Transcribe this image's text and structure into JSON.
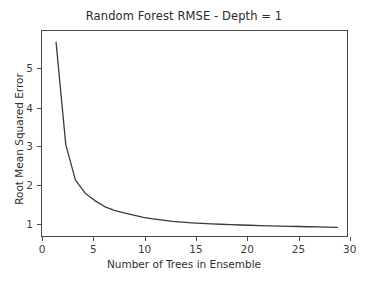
{
  "chart_data": {
    "type": "line",
    "title": "Random Forest RMSE - Depth = 1",
    "xlabel": "Number of Trees in Ensemble",
    "ylabel": "Root Mean Squared Error",
    "xlim": [
      -0.45,
      31.0
    ],
    "ylim": [
      0.55,
      6.05
    ],
    "xticks": [
      0,
      5,
      10,
      15,
      20,
      25,
      30
    ],
    "yticks": [
      1,
      2,
      3,
      4,
      5
    ],
    "grid": false,
    "legend": null,
    "line_color": "#3a3a3a",
    "line_width": 1.3,
    "background_color": "#ffffff",
    "frame_color": "#4a4a4a",
    "x": [
      1,
      2,
      3,
      4,
      5,
      6,
      7,
      8,
      9,
      10,
      11,
      12,
      13,
      14,
      15,
      16,
      17,
      18,
      19,
      20,
      21,
      22,
      23,
      24,
      25,
      26,
      27,
      28,
      29,
      30
    ],
    "series": [
      {
        "name": "RMSE",
        "values": [
          5.75,
          3.0,
          2.05,
          1.7,
          1.5,
          1.34,
          1.24,
          1.17,
          1.11,
          1.05,
          1.01,
          0.975,
          0.945,
          0.925,
          0.905,
          0.89,
          0.875,
          0.865,
          0.855,
          0.845,
          0.838,
          0.83,
          0.823,
          0.816,
          0.81,
          0.805,
          0.798,
          0.792,
          0.786,
          0.78
        ]
      }
    ]
  }
}
